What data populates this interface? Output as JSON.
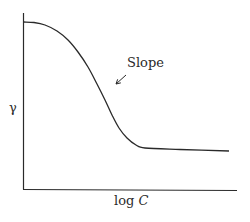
{
  "chart_data": {
    "type": "line",
    "title": "",
    "xlabel": "log C",
    "ylabel": "γ",
    "xlabel_parts": {
      "prefix": "log ",
      "italic": "C"
    },
    "grid": false,
    "legend": null,
    "ticks": {
      "x": [],
      "y": []
    },
    "series": [
      {
        "name": "surface tension vs log concentration",
        "description": "High plateau at low concentration, steep sigmoidal decline, then flat plateau at high concentration",
        "points_px": [
          [
            24,
            22
          ],
          [
            34,
            22.5
          ],
          [
            45,
            25
          ],
          [
            57,
            31
          ],
          [
            68,
            40
          ],
          [
            78,
            52
          ],
          [
            88,
            67
          ],
          [
            97,
            84
          ],
          [
            105,
            100
          ],
          [
            112,
            115
          ],
          [
            119,
            128
          ],
          [
            127,
            138
          ],
          [
            136,
            145
          ],
          [
            145,
            148
          ],
          [
            180,
            149.5
          ],
          [
            229,
            151
          ]
        ]
      }
    ],
    "annotations": [
      {
        "text": "Slope",
        "arrow": true,
        "arrow_from_px": [
          126,
          75
        ],
        "arrow_to_px": [
          116,
          84
        ]
      }
    ],
    "colors": {
      "line": "#2a2a2a",
      "axis": "#2a2a2a",
      "background": "#ffffff"
    }
  }
}
